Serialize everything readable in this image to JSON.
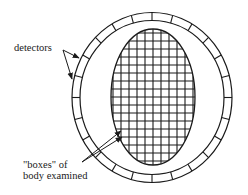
{
  "labels": {
    "detectors": "detectors",
    "boxes_line1": "\"boxes\" of",
    "boxes_line2": "body examined"
  },
  "geometry": {
    "ring_center": [
      152,
      97
    ],
    "ring_outer_r": [
      80,
      85
    ],
    "ring_inner_r": [
      72,
      77
    ],
    "body_ellipse_center": [
      153,
      97
    ],
    "body_ellipse_r": [
      42,
      68
    ],
    "grid_spacing": 8,
    "detector_segments": 24
  },
  "colors": {
    "stroke": "#1a1a1a",
    "background": "#ffffff"
  }
}
